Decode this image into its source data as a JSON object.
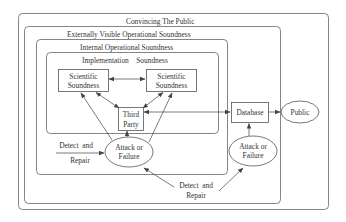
{
  "diagram": {
    "containers": [
      {
        "id": "convincing",
        "label": "Convincing The Public"
      },
      {
        "id": "external",
        "label": "Externally Visible Operational Soundness"
      },
      {
        "id": "internal",
        "label": "Internal Operational Soundness"
      },
      {
        "id": "implementation",
        "label": "Implementation    Soundness"
      }
    ],
    "nodes": {
      "sci1": {
        "line1": "Scientific",
        "line2": "Soundness"
      },
      "sci2": {
        "line1": "Scientific",
        "line2": "Soundness"
      },
      "third": {
        "line1": "Third",
        "line2": "Party"
      },
      "database": {
        "label": "Database"
      },
      "public": {
        "label": "Public"
      },
      "attack_internal": {
        "line1": "Attack or",
        "line2": "Failure"
      },
      "attack_external": {
        "line1": "Attack or",
        "line2": "Failure"
      }
    },
    "annotations": {
      "detect_internal": {
        "line1": "Detect  and",
        "line2": "Repair"
      },
      "detect_external": {
        "line1": "Detect  and",
        "line2": "Repair"
      }
    },
    "edges": [
      {
        "from": "sci1",
        "to": "sci2",
        "type": "bidirectional"
      },
      {
        "from": "third",
        "to": "sci1",
        "type": "bidirectional"
      },
      {
        "from": "third",
        "to": "sci2",
        "type": "bidirectional"
      },
      {
        "from": "attack_internal",
        "to": "sci1"
      },
      {
        "from": "attack_internal",
        "to": "sci2"
      },
      {
        "from": "attack_internal",
        "to": "third"
      },
      {
        "from": "third",
        "to": "database",
        "type": "bidirectional"
      },
      {
        "from": "database",
        "to": "public"
      },
      {
        "from": "attack_external",
        "to": "database"
      },
      {
        "from": "detect_internal",
        "to": "attack_internal"
      },
      {
        "from": "detect_external",
        "to": "attack_internal"
      },
      {
        "from": "detect_external",
        "to": "attack_external"
      }
    ]
  }
}
